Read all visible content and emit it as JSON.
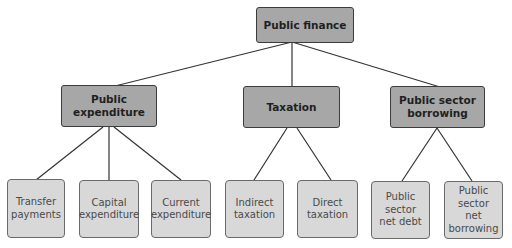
{
  "diagram": {
    "root": {
      "label": "Public finance"
    },
    "branches": [
      {
        "label": "Public\nexpenditure",
        "children": [
          {
            "label": "Transfer\npayments"
          },
          {
            "label": "Capital\nexpenditure"
          },
          {
            "label": "Current\nexpenditure"
          }
        ]
      },
      {
        "label": "Taxation",
        "children": [
          {
            "label": "Indirect\ntaxation"
          },
          {
            "label": "Direct\ntaxation"
          }
        ]
      },
      {
        "label": "Public sector\nborrowing",
        "children": [
          {
            "label": "Public\nsector\nnet debt"
          },
          {
            "label": "Public\nsector\nnet\nborrowing"
          }
        ]
      }
    ],
    "colors": {
      "level1_fill": "#a7a7a7",
      "level2_fill": "#d8d8d8",
      "line": "#333333"
    }
  }
}
